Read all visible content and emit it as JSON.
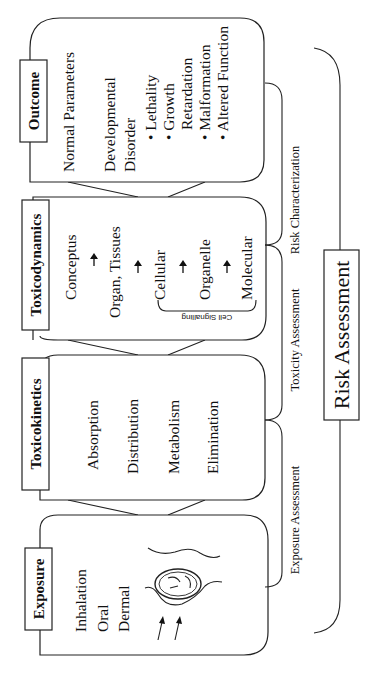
{
  "diagram": {
    "orientation": "rotated -90deg (reads bottom-to-top)",
    "stages": [
      {
        "id": "exposure",
        "title": "Exposure",
        "items": [
          "Inhalation",
          "Oral",
          "Dermal"
        ],
        "illustration": "fetus-in-womb with two arrows"
      },
      {
        "id": "toxicokinetics",
        "title": "Toxicokinetics",
        "items": [
          "Absorption",
          "Distribution",
          "Metabolism",
          "Elimination"
        ]
      },
      {
        "id": "toxicodynamics",
        "title": "Toxicodynamics",
        "items": [
          "Conceptus",
          "Organ, Tissues",
          "Cellular",
          "Organelle",
          "Molecular"
        ],
        "arrow": "↑",
        "bracket_label": "Cell Signalling"
      },
      {
        "id": "outcome",
        "title": "Outcome",
        "items": [
          "Normal Parameters",
          "Developmental",
          "Disorder"
        ],
        "bullets": [
          "Lethality",
          "Growth",
          "Retardation",
          "Malformation",
          "Altered Function"
        ]
      }
    ],
    "assessments": [
      {
        "label": "Exposure Assessment"
      },
      {
        "label": "Toxicity Assessment"
      },
      {
        "label": "Risk Characterization"
      }
    ],
    "overall": {
      "label": "Risk Assessment"
    }
  }
}
